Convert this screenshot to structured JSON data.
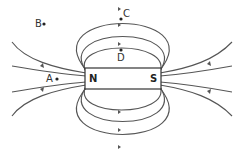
{
  "diagram": {
    "magnet": {
      "north_label": "N",
      "south_label": "S"
    },
    "points": [
      {
        "label": "A",
        "x": 57,
        "y": 79
      },
      {
        "label": "B",
        "x": 44,
        "y": 24
      },
      {
        "label": "C",
        "x": 121,
        "y": 19
      },
      {
        "label": "D",
        "x": 121,
        "y": 50
      }
    ],
    "colors": {
      "line": "#555555",
      "magnet_border": "#333333",
      "magnet_fill": "#ffffff"
    }
  }
}
